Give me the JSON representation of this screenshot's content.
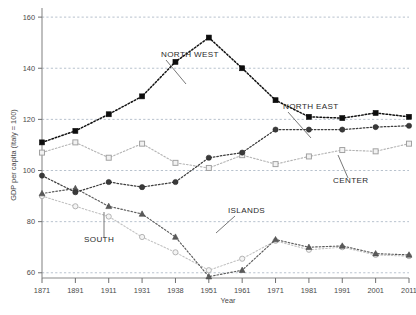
{
  "chart_data": {
    "type": "line",
    "title": "",
    "xlabel": "Year",
    "ylabel": "GDP per capita (Italy = 100)",
    "x": [
      1871,
      1891,
      1911,
      1931,
      1938,
      1951,
      1961,
      1971,
      1981,
      1991,
      2001,
      2011
    ],
    "xtick_labels": [
      "1871",
      "1891",
      "1911",
      "1931",
      "1938",
      "1951",
      "1961",
      "1971",
      "1981",
      "1991",
      "2001",
      "2011"
    ],
    "ytick_labels": [
      "60",
      "80",
      "100",
      "120",
      "140",
      "160"
    ],
    "yticks": [
      60,
      80,
      100,
      120,
      140,
      160
    ],
    "ylim": [
      56,
      162
    ],
    "xlim": [
      1866,
      2016
    ],
    "grid": "horizontal-dashed",
    "legend": "inline-annotations",
    "series": [
      {
        "name": "NORTH WEST",
        "marker": "filled-square",
        "color": "#0d0d0d",
        "values": [
          111,
          115.5,
          122,
          129,
          142.5,
          152,
          140,
          127.5,
          121,
          120.5,
          122.5,
          121
        ]
      },
      {
        "name": "NORTH EAST",
        "marker": "filled-circle",
        "color": "#3a3a3a",
        "values": [
          98,
          91.5,
          95.5,
          93.5,
          95.5,
          105,
          107,
          116,
          116,
          116,
          117,
          117.5
        ]
      },
      {
        "name": "CENTER",
        "marker": "open-square",
        "color": "#9e9e9e",
        "values": [
          107,
          111,
          105,
          110.5,
          103,
          101,
          106,
          102.5,
          105.5,
          108,
          107.5,
          110.5
        ]
      },
      {
        "name": "SOUTH",
        "marker": "filled-triangle",
        "color": "#5a5a5a",
        "values": [
          91,
          93,
          86,
          83,
          74,
          58.5,
          61,
          73,
          70,
          70.5,
          67.5,
          67
        ]
      },
      {
        "name": "ISLANDS",
        "marker": "open-circle",
        "color": "#b0b0b0",
        "values": [
          90,
          86,
          82,
          74,
          68,
          61,
          65.5,
          72.5,
          69,
          70,
          67,
          66.5
        ]
      }
    ],
    "annotations": [
      {
        "label": "NORTH WEST",
        "x": 161,
        "y": 57,
        "leader": "M166,60 L186,84"
      },
      {
        "label": "NORTH EAST",
        "x": 283,
        "y": 109,
        "leader": "M288,112 L311,138"
      },
      {
        "label": "CENTER",
        "x": 333,
        "y": 183,
        "leader": "M348,178 L338,155"
      },
      {
        "label": "ISLANDS",
        "x": 228,
        "y": 213,
        "leader": "M235,216 L216,233"
      },
      {
        "label": "SOUTH",
        "x": 84,
        "y": 242,
        "leader": "M104,238 L104,212"
      }
    ]
  }
}
